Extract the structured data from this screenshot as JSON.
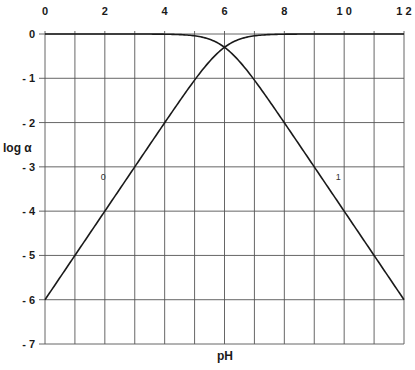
{
  "chart_data": {
    "type": "line",
    "title": "",
    "xlabel": "pH",
    "ylabel": "log α",
    "xlim": [
      0,
      12
    ],
    "ylim": [
      -7,
      0
    ],
    "x_ticks": [
      "0",
      "2",
      "4",
      "6",
      "8",
      "1 0",
      "1 2"
    ],
    "x_tick_values": [
      0,
      2,
      4,
      6,
      8,
      10,
      12
    ],
    "y_ticks": [
      "0",
      "- 1",
      "- 2",
      "- 3",
      "- 4",
      "- 5",
      "- 6",
      "- 7"
    ],
    "y_tick_values": [
      0,
      -1,
      -2,
      -3,
      -4,
      -5,
      -6,
      -7
    ],
    "x_axis_position": "top",
    "grid": true,
    "grid_x_step": 1,
    "grid_y_step": 1,
    "legend": null,
    "pKa": 6,
    "series": [
      {
        "name": "0",
        "description": "log α0 (acid form)",
        "x": [
          0,
          1,
          2,
          3,
          4,
          5,
          5.5,
          6,
          6.5,
          7,
          8,
          9,
          10,
          11,
          12
        ],
        "values": [
          -6.0,
          -5.0,
          -4.0,
          -3.0,
          -2.0,
          -1.04,
          -0.62,
          -0.3,
          -0.12,
          -0.04,
          -0.004,
          0,
          0,
          0,
          0
        ]
      },
      {
        "name": "1",
        "description": "log α1 (base form)",
        "x": [
          0,
          1,
          2,
          3,
          4,
          5,
          5.5,
          6,
          6.5,
          7,
          8,
          9,
          10,
          11,
          12
        ],
        "values": [
          0,
          0,
          0,
          0,
          -0.004,
          -0.04,
          -0.12,
          -0.3,
          -0.62,
          -1.04,
          -2.0,
          -3.0,
          -4.0,
          -5.0,
          -6.0
        ]
      }
    ],
    "annotations": [
      {
        "text": "0",
        "x": 1.95,
        "y": -3.3
      },
      {
        "text": "1",
        "x": 9.8,
        "y": -3.3
      }
    ]
  }
}
